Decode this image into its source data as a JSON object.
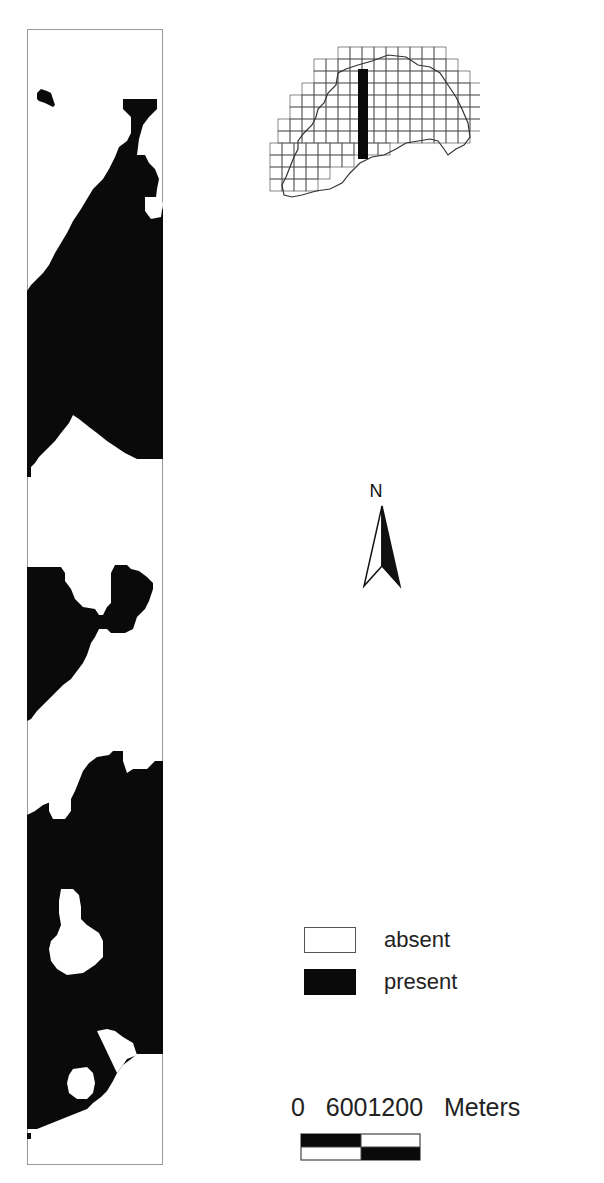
{
  "map": {
    "strip": {
      "width": 136,
      "height": 1136,
      "present_color": "#0a0a0a",
      "absent_color": "#ffffff",
      "border_color": "#9a9a9a",
      "present_polygons": [
        "96,70 130,70 130,80 122,88 116,96 112,110 110,126 118,126 122,134 128,140 132,150 130,160 128,176 136,180 136,430 110,430 98,424 80,412 70,404 62,398 52,390 46,386 42,394 34,404 28,412 20,420 12,428 8,434 4,438 4,448 0,448 0,262 4,256 10,250 16,244 22,236 28,224 34,214 40,204 46,192 54,180 60,170 66,160 76,150 82,140 88,128 92,118 100,112 104,104 104,88 96,80",
        "10,64 14,60 20,62 24,64 26,70 28,76 26,78 18,74 12,72 10,70"
      ],
      "absent_holes": [
        "118,168 130,168 136,174 134,188 124,190 118,182"
      ],
      "present_polygons_2": [
        "0,538 34,538 38,544 38,552 44,560 48,570 56,578 68,580 72,586 76,586 80,578 84,574 84,544 88,536 100,536 104,540 112,542 120,548 126,554 126,560 122,572 118,580 110,588 106,600 98,604 84,604 80,600 72,600 68,608 64,614 60,626 56,634 50,642 44,650 36,656 30,662 24,668 18,674 10,682 4,690 0,692",
        "0,786 8,782 16,776 26,772 34,772 38,776 44,770 48,762 52,752 56,742 62,734 70,728 82,726 86,722 96,722 96,732 100,744 106,740 120,740 128,732 136,732 136,1025 110,1025 104,1030 96,1036 90,1044 86,1052 80,1062 74,1068 66,1074 60,1080 50,1084 40,1088 30,1092 20,1096 10,1100 0,1100 0,902 4,906 10,914 14,920 20,924 20,930 22,936 22,950 0,950"
      ],
      "absent_holes_2": [
        "26,764 40,764 44,770 44,782 38,790 26,790 22,782 22,772",
        "34,860 46,860 52,866 54,878 54,890 60,896 72,904 76,912 76,928 68,936 56,944 40,946 30,940 24,932 22,920 24,912 30,906 34,896 32,884 32,872",
        "70,1002 80,1000 88,1002 96,1008 106,1014 110,1026 100,1030 96,1036 90,1044",
        "46,1040 60,1038 66,1044 68,1054 66,1064 60,1070 50,1070 42,1064 40,1054 42,1046"
      ],
      "tail_dot": "0,1104 4,1104 4,1110 0,1110"
    },
    "inset": {
      "grid_color": "#555555",
      "boundary_color": "#333333",
      "highlight_color": "#0a0a0a",
      "cell_size": 12
    },
    "north_arrow": {
      "label": "N"
    },
    "legend": {
      "items": [
        {
          "label": "absent",
          "swatch": "#ffffff"
        },
        {
          "label": "present",
          "swatch": "#0a0a0a"
        }
      ]
    },
    "scale_bar": {
      "ticks": [
        "0",
        "600",
        "1200"
      ],
      "text": "0   6001200   Meters",
      "unit": "Meters"
    }
  }
}
